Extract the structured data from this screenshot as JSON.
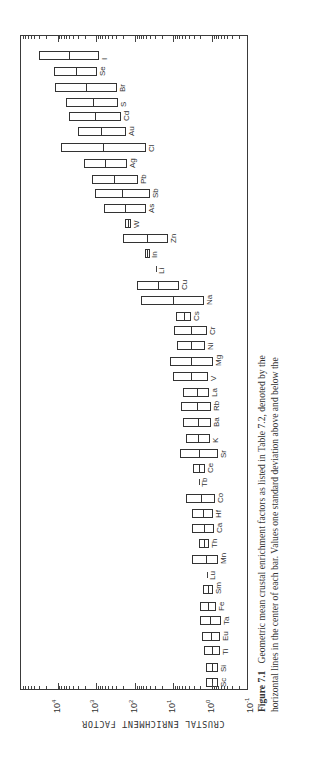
{
  "chart_data": {
    "type": "bar",
    "orientation": "rotated-90ccw",
    "title": "",
    "ylabel": "CRUSTAL ENRICHMENT FACTOR",
    "xlabel": "",
    "scale": "log",
    "ylim": [
      0.1,
      100000
    ],
    "tick_labels": [
      "10^-1",
      "10^0",
      "10^1",
      "10^2",
      "10^3",
      "10^4"
    ],
    "grid": false,
    "legend": null,
    "value_format": "log10 of geometric mean, with log10 of mean + 1 SD (upper) and mean - 1 SD (lower)",
    "categories": [
      "Sc",
      "Si",
      "Ti",
      "Eu",
      "Ta",
      "Fe",
      "Sm",
      "Lu",
      "Mn",
      "Th",
      "Ca",
      "Hf",
      "Co",
      "Tb",
      "Ce",
      "Sr",
      "K",
      "Ba",
      "Rb",
      "La",
      "V",
      "Mg",
      "Ni",
      "Cr",
      "Cs",
      "Na",
      "Cu",
      "Li",
      "In",
      "Zn",
      "W",
      "As",
      "Sb",
      "Pb",
      "Ag",
      "Cl",
      "Au",
      "Cd",
      "S",
      "Br",
      "Se",
      "I"
    ],
    "series": [
      {
        "name": "log10 mean",
        "values": [
          0.0,
          0.0,
          0.0,
          0.03,
          0.05,
          0.1,
          0.1,
          0.13,
          0.16,
          0.21,
          0.21,
          0.23,
          0.28,
          0.34,
          0.34,
          0.34,
          0.36,
          0.36,
          0.39,
          0.39,
          0.54,
          0.54,
          0.54,
          0.54,
          0.73,
          1.01,
          1.4,
          1.45,
          1.68,
          1.68,
          2.18,
          2.25,
          2.33,
          2.54,
          2.77,
          2.82,
          2.88,
          3.03,
          3.08,
          3.26,
          3.52,
          3.7
        ]
      },
      {
        "name": "log10 upper (+1 SD)",
        "values": [
          0.16,
          0.16,
          0.21,
          0.26,
          0.31,
          0.31,
          0.23,
          null,
          0.52,
          0.34,
          0.52,
          0.52,
          0.67,
          null,
          0.49,
          0.83,
          0.67,
          0.75,
          0.8,
          0.75,
          1.01,
          1.09,
          0.91,
          0.98,
          0.93,
          1.84,
          1.94,
          null,
          1.74,
          2.31,
          2.25,
          2.8,
          3.03,
          3.11,
          3.32,
          3.91,
          3.47,
          3.7,
          3.78,
          4.07,
          4.09,
          4.48
        ]
      },
      {
        "name": "log10 lower (-1 SD)",
        "values": [
          -0.16,
          -0.16,
          -0.21,
          -0.21,
          -0.23,
          -0.1,
          -0.03,
          null,
          -0.16,
          0.08,
          -0.05,
          -0.03,
          -0.08,
          null,
          0.18,
          -0.16,
          0.05,
          0.03,
          0.03,
          0.08,
          0.1,
          -0.03,
          0.18,
          0.13,
          0.54,
          0.21,
          0.85,
          null,
          1.63,
          1.14,
          2.1,
          1.71,
          1.61,
          1.92,
          2.2,
          1.71,
          2.23,
          2.36,
          2.44,
          2.46,
          2.98,
          2.93
        ]
      }
    ]
  },
  "layout": {
    "plot": {
      "left": 20,
      "top": 35,
      "width": 228,
      "height": 655
    },
    "decade_px": 38.6,
    "zero_x": 211,
    "row_y": [
      681,
      666,
      649,
      635,
      619,
      605,
      588,
      574,
      558,
      542,
      527,
      512,
      497,
      481,
      467,
      452,
      437,
      421,
      405,
      391,
      375,
      360,
      344,
      329,
      315,
      299,
      284,
      268,
      252,
      237,
      222,
      207,
      192,
      178,
      162,
      146,
      130,
      115,
      101,
      86,
      70,
      54
    ],
    "bar_half_height": 4.5
  },
  "axis": {
    "label": "CRUSTAL ENRICHMENT FACTOR",
    "ticks": [
      {
        "base": "10",
        "exp": "4",
        "log": 4
      },
      {
        "base": "10",
        "exp": "3",
        "log": 3
      },
      {
        "base": "10",
        "exp": "2",
        "log": 2
      },
      {
        "base": "10",
        "exp": "1",
        "log": 1
      },
      {
        "base": "10",
        "exp": "0",
        "log": 0
      },
      {
        "base": "10",
        "exp": "-1",
        "log": -1
      }
    ]
  },
  "caption": {
    "figure_label": "Figure 7.1",
    "line1": "Geometric mean crustal enrichment factors as listed in Table 7.2, denoted by the",
    "line2": "horizontal lines in the center of each bar. Values one standard deviation above and below the"
  }
}
